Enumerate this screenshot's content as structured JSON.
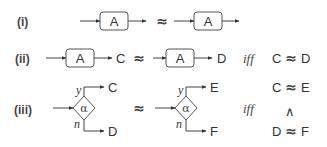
{
  "rows": [
    {
      "label": "(i)",
      "left": {
        "box": "A"
      },
      "relation": "≈",
      "right": {
        "box": "A"
      }
    },
    {
      "label": "(ii)",
      "left": {
        "box": "A",
        "out": "C"
      },
      "relation": "≈",
      "right": {
        "box": "A",
        "out": "D"
      },
      "iff": "iff",
      "condition": {
        "lhs": "C",
        "rel": "≈",
        "rhs": "D"
      }
    },
    {
      "label": "(iii)",
      "left": {
        "cond": "α",
        "yes_label": "y",
        "no_label": "n",
        "yes_out": "C",
        "no_out": "D"
      },
      "relation": "≈",
      "right": {
        "cond": "α",
        "yes_label": "y",
        "no_label": "n",
        "yes_out": "E",
        "no_out": "F"
      },
      "iff": "iff",
      "condition": {
        "line1": {
          "lhs": "C",
          "rel": "≈",
          "rhs": "E"
        },
        "conj": "∧",
        "line2": {
          "lhs": "D",
          "rel": "≈",
          "rhs": "F"
        }
      }
    }
  ]
}
